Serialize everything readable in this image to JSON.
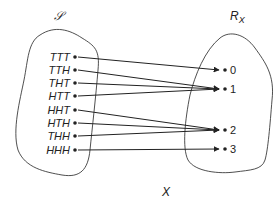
{
  "diagram": {
    "sample_space_label": "𝒮",
    "range_label": "R",
    "range_label_sub": "X",
    "function_label": "X",
    "colors": {
      "stroke": "#222222",
      "background": "#ffffff"
    },
    "outcomes": [
      {
        "label": "TTT",
        "y": 57,
        "maps_to": "0"
      },
      {
        "label": "TTH",
        "y": 70,
        "maps_to": "1"
      },
      {
        "label": "THT",
        "y": 83,
        "maps_to": "1"
      },
      {
        "label": "HTT",
        "y": 96,
        "maps_to": "1"
      },
      {
        "label": "HHT",
        "y": 110,
        "maps_to": "2"
      },
      {
        "label": "HTH",
        "y": 123,
        "maps_to": "2"
      },
      {
        "label": "THH",
        "y": 136,
        "maps_to": "2"
      },
      {
        "label": "HHH",
        "y": 150,
        "maps_to": "3"
      }
    ],
    "values": [
      {
        "label": "0",
        "y": 70
      },
      {
        "label": "1",
        "y": 89
      },
      {
        "label": "2",
        "y": 130
      },
      {
        "label": "3",
        "y": 149
      }
    ]
  }
}
